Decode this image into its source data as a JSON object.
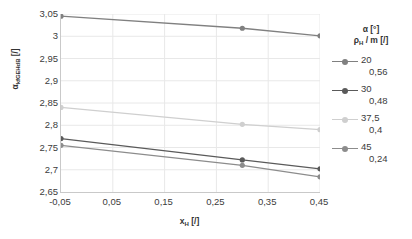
{
  "chart_data": {
    "type": "line",
    "title": "",
    "xlabel": "x_H [/]",
    "ylabel": "alpha_kfGEHdB [/]",
    "xlim": [
      -0.05,
      0.45
    ],
    "ylim": [
      2.65,
      3.05
    ],
    "grid": true,
    "legend_position": "right",
    "x": [
      -0.05,
      0.3,
      0.45
    ],
    "xticks": [
      "-0,05",
      "0,05",
      "0,15",
      "0,25",
      "0,35",
      "0,45"
    ],
    "xtick_values": [
      -0.05,
      0.05,
      0.15,
      0.25,
      0.35,
      0.45
    ],
    "yticks": [
      "2,65",
      "2,7",
      "2,75",
      "2,8",
      "2,85",
      "2,9",
      "2,95",
      "3",
      "3,05"
    ],
    "ytick_values": [
      2.65,
      2.7,
      2.75,
      2.8,
      2.85,
      2.9,
      2.95,
      3.0,
      3.05
    ],
    "series": [
      {
        "name": "20",
        "alpha": "20",
        "rho": "0,56",
        "color": "#808080",
        "values": [
          3.045,
          3.018,
          3.001
        ]
      },
      {
        "name": "30",
        "alpha": "30",
        "rho": "0,48",
        "color": "#5a5a5a",
        "values": [
          2.77,
          2.722,
          2.702
        ]
      },
      {
        "name": "37,5",
        "alpha": "37,5",
        "rho": "0,4",
        "color": "#cfcfcf",
        "values": [
          2.84,
          2.802,
          2.79
        ]
      },
      {
        "name": "45",
        "alpha": "45",
        "rho": "0,24",
        "color": "#8c8c8c",
        "values": [
          2.755,
          2.71,
          2.684
        ]
      }
    ]
  },
  "axes": {
    "y_title_main": "α",
    "y_title_sub": "kfGEHdB",
    "y_title_unit": " [/]",
    "x_title_main": "x",
    "x_title_sub": "H",
    "x_title_unit": " [/]"
  },
  "legend": {
    "header_alpha_main": "α",
    "header_alpha_unit": " [°]",
    "header_rho_main": "ρ",
    "header_rho_sub": "H",
    "header_rho_unit": " / m [/]"
  },
  "colors": {
    "grid": "#e8e8e8",
    "axis": "#c9c9c9",
    "text": "#3c3c3c",
    "background": "#ffffff"
  }
}
